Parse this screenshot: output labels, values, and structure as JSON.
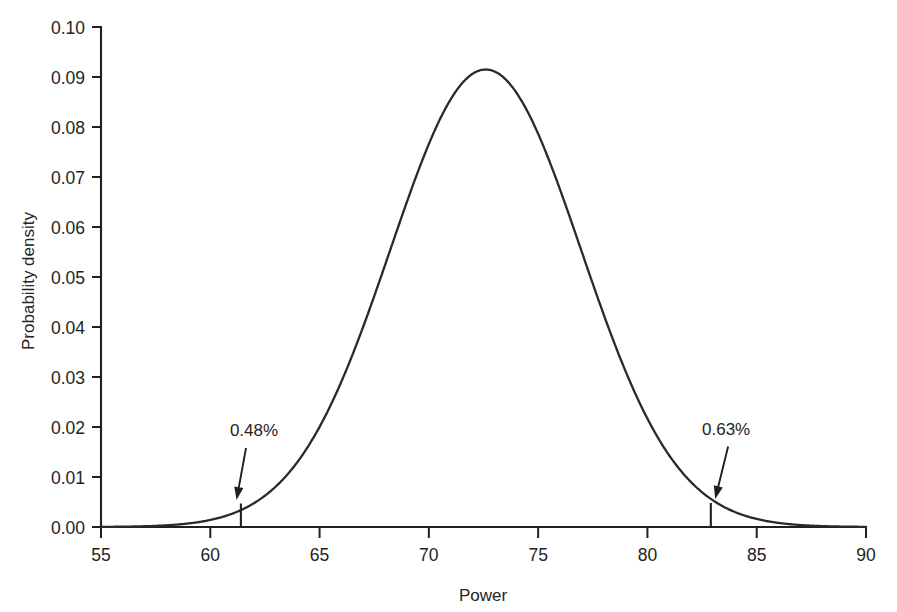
{
  "chart_data": {
    "type": "line",
    "title": "",
    "subtitle": "",
    "xlabel": "Power",
    "ylabel": "Probability density",
    "xlim": [
      55,
      90
    ],
    "ylim": [
      0.0,
      0.1
    ],
    "grid": false,
    "legend": "none",
    "distribution": {
      "family": "normal",
      "mean": 72.6,
      "sigma": 4.36,
      "peak_density": 0.0915
    },
    "xticks": [
      55,
      60,
      65,
      70,
      75,
      80,
      85,
      90
    ],
    "xtick_labels": [
      "55",
      "60",
      "65",
      "70",
      "75",
      "80",
      "85",
      "90"
    ],
    "yticks": [
      0.0,
      0.01,
      0.02,
      0.03,
      0.04,
      0.05,
      0.06,
      0.07,
      0.08,
      0.09,
      0.1
    ],
    "ytick_labels": [
      "0.00",
      "0.01",
      "0.02",
      "0.03",
      "0.04",
      "0.05",
      "0.06",
      "0.07",
      "0.08",
      "0.09",
      "0.10"
    ],
    "x": [
      55,
      56,
      57,
      58,
      59,
      60,
      61,
      62,
      63,
      64,
      65,
      66,
      67,
      68,
      69,
      70,
      71,
      72,
      72.6,
      73,
      74,
      75,
      76,
      77,
      78,
      79,
      80,
      81,
      82,
      83,
      84,
      85,
      86,
      87,
      88,
      89,
      90
    ],
    "values": [
      8e-05,
      0.00018,
      0.00039,
      0.00079,
      0.00153,
      0.00279,
      0.00483,
      0.00793,
      0.01237,
      0.01831,
      0.02574,
      0.03437,
      0.04361,
      0.05259,
      0.06033,
      0.06591,
      0.06872,
      0.06854,
      0.0915,
      0.06548,
      0.05998,
      0.05245,
      0.04369,
      0.03459,
      0.02596,
      0.01853,
      0.01256,
      0.00809,
      0.00495,
      0.00288,
      0.00159,
      0.00083,
      0.00041,
      0.00019,
      9e-05,
      4e-05,
      1e-05
    ],
    "annotations": [
      {
        "label": "0.48%",
        "marker_x": 61.4,
        "marker_height": 0.0047,
        "label_x": 62.0,
        "label_y": 0.0182,
        "arrow_to_x": 61.2,
        "arrow_to_y": 0.0046,
        "side": "left"
      },
      {
        "label": "0.63%",
        "marker_x": 82.9,
        "marker_height": 0.0048,
        "label_x": 83.6,
        "label_y": 0.0185,
        "arrow_to_x": 83.1,
        "arrow_to_y": 0.0048,
        "side": "right"
      }
    ]
  },
  "colors": {
    "curve": "#2a2a29",
    "axis": "#20201f",
    "text": "#242423",
    "background": "#ffffff"
  }
}
